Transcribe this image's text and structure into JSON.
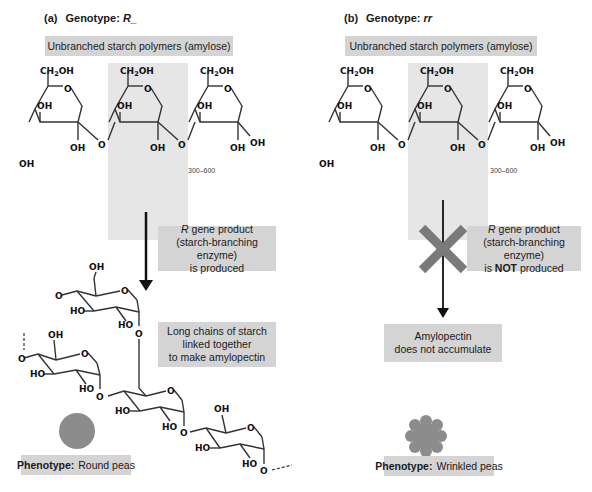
{
  "panels": [
    {
      "id": "a",
      "label": "(a)",
      "genotype_prefix": "Genotype:",
      "genotype": "R_",
      "polymer_box": "Unbranched starch polymers (amylose)",
      "repeat_count": "300–600",
      "enzyme_box": {
        "gene": "R",
        "line1": " gene product",
        "line2": "(starch-branching enzyme)",
        "line3": "is produced"
      },
      "result_box": {
        "line1": "Long chains of starch",
        "line2": "linked together",
        "line3": "to make amylopectin"
      },
      "phenotype_label": "Phenotype:",
      "phenotype_value": "Round peas"
    },
    {
      "id": "b",
      "label": "(b)",
      "genotype_prefix": "Genotype:",
      "genotype": "rr",
      "polymer_box": "Unbranched starch polymers (amylose)",
      "repeat_count": "300–600",
      "enzyme_box": {
        "gene": "R",
        "line1": " gene product",
        "line2": "(starch-branching enzyme)",
        "line3_pre": "is ",
        "line3_bold": "NOT",
        "line3_post": " produced"
      },
      "result_box": {
        "line1": "Amylopectin",
        "line2": "does not accumulate"
      },
      "phenotype_label": "Phenotype:",
      "phenotype_value": "Wrinkled peas"
    }
  ],
  "chem_labels": {
    "ch2oh": "CH",
    "sub2": "2",
    "oh_suffix": "OH",
    "oh": "OH",
    "ho": "HO",
    "o": "O"
  },
  "colors": {
    "box_gray": "#d4d4d4",
    "shade_gray": "#e6e6e6",
    "pea_gray": "#8c8c8c",
    "cross_gray": "#7a7a7a"
  }
}
